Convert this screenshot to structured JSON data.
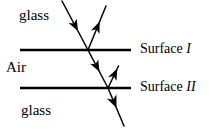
{
  "figure": {
    "width": 209,
    "height": 133,
    "background_color": "#ffffff",
    "stroke_color": "#000000"
  },
  "labels": {
    "glass_top": "glass",
    "medium_middle": "Air",
    "glass_bottom": "glass",
    "surface_1_text": "Surface ",
    "surface_1_numeral": "I",
    "surface_2_text": "Surface ",
    "surface_2_numeral": "II"
  },
  "surfaces": [
    {
      "name": "surface-1",
      "label": "Surface I",
      "y": 50,
      "x_start": 20,
      "x_end": 131,
      "thickness": 2.6
    },
    {
      "name": "surface-2",
      "label": "Surface II",
      "y": 88,
      "x_start": 20,
      "x_end": 131,
      "thickness": 2.6
    }
  ],
  "rays": [
    {
      "name": "incident-ray",
      "description": "incident ray in upper glass travelling down-right toward Surface I",
      "from": [
        62,
        1
      ],
      "to": [
        88,
        50
      ],
      "arrow_at": [
        74.5,
        24.5
      ],
      "arrow_direction": "down-right"
    },
    {
      "name": "reflected-ray-surface-1",
      "description": "ray reflected at Surface I travelling up-right into upper glass",
      "from": [
        88,
        50
      ],
      "to": [
        106,
        6
      ],
      "arrow_at": [
        96.5,
        28
      ],
      "arrow_direction": "up-right"
    },
    {
      "name": "refracted-ray-air",
      "description": "refracted ray crossing the air layer from Surface I to Surface II",
      "from": [
        88,
        50
      ],
      "to": [
        108,
        88
      ],
      "arrow_at": [
        97,
        68
      ],
      "arrow_direction": "down-right"
    },
    {
      "name": "reflected-ray-surface-2",
      "description": "ray reflected at Surface II travelling up-right in the air layer",
      "from": [
        108,
        88
      ],
      "to": [
        117,
        68
      ],
      "arrow_at": [
        113,
        75
      ],
      "arrow_direction": "up-right"
    },
    {
      "name": "transmitted-ray-bottom",
      "description": "ray transmitted through Surface II into the lower glass",
      "from": [
        108,
        88
      ],
      "to": [
        124,
        126
      ],
      "arrow_at": [
        114,
        101
      ],
      "arrow_direction": "down-right"
    }
  ],
  "colors": {
    "line": "#000000",
    "background": "#ffffff",
    "text": "#000000"
  }
}
